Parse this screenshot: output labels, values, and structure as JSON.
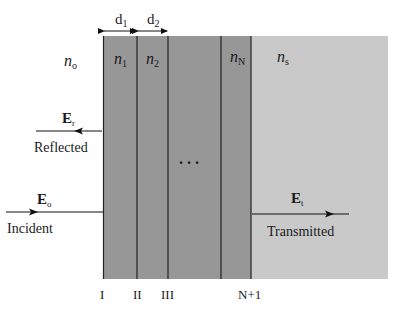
{
  "diagram": {
    "thickness_labels": [
      {
        "base": "d",
        "sub": "1"
      },
      {
        "base": "d",
        "sub": "2"
      }
    ],
    "media": {
      "incident": {
        "base": "n",
        "sub": "o"
      },
      "layers": [
        {
          "base": "n",
          "sub": "1"
        },
        {
          "base": "n",
          "sub": "2"
        },
        {
          "base": "n",
          "sub": "N"
        }
      ],
      "substrate": {
        "base": "n",
        "sub": "s"
      }
    },
    "ellipsis": ". . .",
    "waves": {
      "reflected": {
        "field": "E",
        "sub": "r",
        "label": "Reflected"
      },
      "incident": {
        "field": "E",
        "sub": "o",
        "label": "Incident"
      },
      "transmitted": {
        "field": "E",
        "sub": "t",
        "label": "Transmitted"
      }
    },
    "interfaces": [
      "I",
      "II",
      "III",
      "N+1"
    ],
    "colors": {
      "layer": "#969696",
      "substrate": "#c8c8c8",
      "lines": "#222222"
    }
  }
}
